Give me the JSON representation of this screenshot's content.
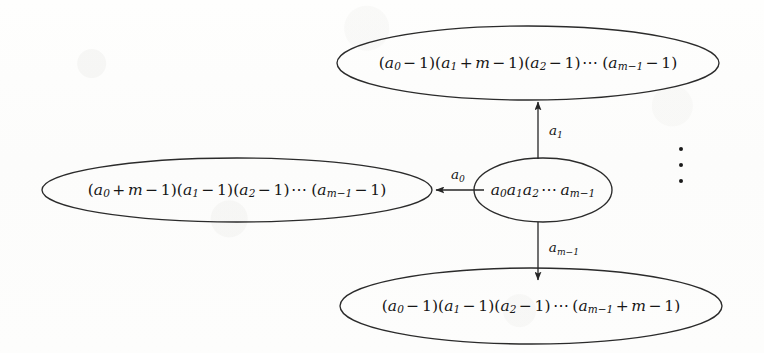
{
  "figure": {
    "type": "state-transition-diagram",
    "background_color": "#fdfdfc",
    "stroke_color": "#262626",
    "text_color": "#161616",
    "width": 764,
    "height": 353
  },
  "nodes": {
    "center": {
      "name": "center-node",
      "latex": "a_0 a_1 a_2 \\cdots a_{m-1}",
      "plain": "a0a1a2 ... a(m-1)",
      "cx": 543,
      "cy": 190,
      "rx": 69,
      "ry": 32,
      "parts": [
        {
          "t": "var",
          "v": "a",
          "sub": "0"
        },
        {
          "t": "var",
          "v": "a",
          "sub": "1"
        },
        {
          "t": "var",
          "v": "a",
          "sub": "2"
        },
        {
          "t": "cdots",
          "v": "⋯"
        },
        {
          "t": "var",
          "v": "a",
          "sub": "m−1"
        }
      ]
    },
    "top": {
      "name": "top-node",
      "latex": "(a_0-1)(a_1+m-1)(a_2-1)\\cdots(a_{m-1}-1)",
      "plain": "(a0-1)(a1+m-1)(a2-1) ... (a(m-1)-1)",
      "cx": 528,
      "cy": 63,
      "rx": 191,
      "ry": 37
    },
    "left": {
      "name": "left-node",
      "latex": "(a_0+m-1)(a_1-1)(a_2-1)\\cdots(a_{m-1}-1)",
      "plain": "(a0+m-1)(a1-1)(a2-1) ... (a(m-1)-1)",
      "cx": 237,
      "cy": 190,
      "rx": 195,
      "ry": 32
    },
    "bottom": {
      "name": "bottom-node",
      "latex": "(a_0-1)(a_1-1)(a_2-1)\\cdots(a_{m-1}+m-1)",
      "plain": "(a0-1)(a1-1)(a2-1) ... (a(m-1)+m-1)",
      "cx": 531,
      "cy": 306,
      "rx": 191,
      "ry": 38
    }
  },
  "edges": [
    {
      "name": "edge-a0",
      "from": "center",
      "to": "left",
      "direction": "left",
      "label_var": "a",
      "label_sub": "0",
      "label_x": 458,
      "label_y": 175,
      "x1": 484,
      "y1": 190,
      "x2": 434,
      "y2": 190
    },
    {
      "name": "edge-a1",
      "from": "center",
      "to": "top",
      "direction": "up",
      "label_var": "a",
      "label_sub": "1",
      "label_x": 556,
      "label_y": 131,
      "x1": 538,
      "y1": 159,
      "x2": 538,
      "y2": 100
    },
    {
      "name": "edge-am1",
      "from": "center",
      "to": "bottom",
      "direction": "down",
      "label_var": "a",
      "label_sub": "m−1",
      "label_x": 564,
      "label_y": 248,
      "x1": 538,
      "y1": 222,
      "x2": 538,
      "y2": 282
    }
  ],
  "vertical_ellipsis": {
    "name": "vertical-ellipsis",
    "glyph": "⋮",
    "dot_count": 3,
    "cx": 681,
    "cy": 165
  },
  "symbols": {
    "minus": "−",
    "plus": "+",
    "one": "1",
    "m": "m",
    "cdots": "⋯",
    "lparen": "(",
    "rparen": ")",
    "a": "a"
  }
}
